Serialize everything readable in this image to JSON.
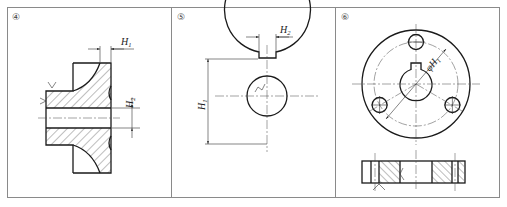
{
  "figure": {
    "type": "engineering-drawing-exercises",
    "panels": [
      {
        "id": "panel-4",
        "number": "④",
        "view": "half section of flanged bushing",
        "dimensions": [
          {
            "symbol": "H",
            "subscript": "1",
            "orientation": "horizontal"
          },
          {
            "symbol": "H",
            "subscript": "2",
            "orientation": "vertical"
          }
        ]
      },
      {
        "id": "panel-5",
        "number": "⑤",
        "view": "front view of washer with keyway",
        "dimensions": [
          {
            "symbol": "H",
            "subscript": "2",
            "orientation": "horizontal"
          },
          {
            "symbol": "H",
            "subscript": "1",
            "orientation": "vertical"
          }
        ]
      },
      {
        "id": "panel-6",
        "number": "⑥",
        "view": "flange with three holes, top and section views",
        "dimensions": [
          {
            "symbol": "φH",
            "subscript": "1",
            "orientation": "diagonal"
          }
        ]
      }
    ]
  },
  "colors": {
    "frame": "#8a8a8a",
    "line": "#1a1a1a",
    "background": "#ffffff"
  }
}
